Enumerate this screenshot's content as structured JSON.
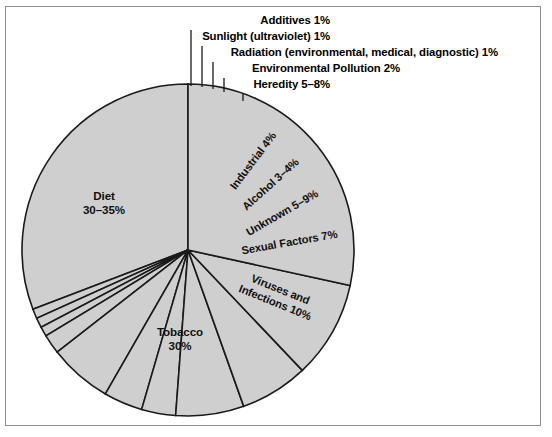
{
  "figure": {
    "background_color": "#ffffff",
    "frame_color": "#8d8d8d",
    "slice_fill": "#cfcfcf",
    "slice_stroke": "#1a1a1a"
  },
  "chart_data": {
    "type": "pie",
    "title": "",
    "subtitle": "",
    "xlabel": "",
    "ylabel": "",
    "grid": false,
    "legend_position": "none",
    "center": {
      "x": 188,
      "y": 250
    },
    "radius": 166,
    "start_angle_deg": -90,
    "direction": "counterclockwise",
    "categories": [
      "Diet",
      "Additives",
      "Sunlight (ultraviolet)",
      "Radiation (environmental, medical, diagnostic)",
      "Environmental Pollution",
      "Heredity",
      "Industrial",
      "Alcohol",
      "Unknown",
      "Sexual Factors",
      "Viruses and Infections",
      "Tobacco"
    ],
    "values": [
      32.5,
      1,
      1,
      1,
      2,
      6.5,
      4,
      3.5,
      7,
      7,
      10,
      30
    ],
    "value_labels": [
      "30–35%",
      "1%",
      "1%",
      "1%",
      "2%",
      "5–8%",
      "4%",
      "3–4%",
      "5–9%",
      "7%",
      "10%",
      "30%"
    ],
    "slices": [
      {
        "name": "diet",
        "category": "Diet",
        "value": 32.5,
        "value_label": "30–35%",
        "label_mode": "inner-horizontal",
        "label_lines": [
          "Diet",
          "30–35%"
        ],
        "label_x": 104,
        "label_y": 200,
        "rotation": 0
      },
      {
        "name": "additives",
        "category": "Additives",
        "value": 1,
        "value_label": "1%",
        "label_mode": "callout",
        "label_text": "Additives 1%",
        "text_x": 330,
        "text_y": 24,
        "leader": {
          "x1": 191,
          "y1": 30,
          "x2": 191,
          "y2": 86
        }
      },
      {
        "name": "sunlight-ultraviolet",
        "category": "Sunlight (ultraviolet)",
        "value": 1,
        "value_label": "1%",
        "label_mode": "callout",
        "label_text": "Sunlight (ultraviolet) 1%",
        "text_x": 330,
        "text_y": 40,
        "leader": {
          "x1": 202,
          "y1": 46,
          "x2": 202,
          "y2": 87
        }
      },
      {
        "name": "radiation",
        "category": "Radiation (environmental, medical, diagnostic)",
        "value": 1,
        "value_label": "1%",
        "label_mode": "callout",
        "label_text": "Radiation (environmental, medical, diagnostic) 1%",
        "text_x": 498,
        "text_y": 56,
        "leader": {
          "x1": 213,
          "y1": 62,
          "x2": 213,
          "y2": 89
        }
      },
      {
        "name": "environmental-pollution",
        "category": "Environmental Pollution",
        "value": 2,
        "value_label": "2%",
        "label_mode": "callout",
        "label_text": "Environmental Pollution 2%",
        "text_x": 400,
        "text_y": 72,
        "leader": {
          "x1": 224,
          "y1": 78,
          "x2": 224,
          "y2": 92
        }
      },
      {
        "name": "heredity",
        "category": "Heredity",
        "value": 6.5,
        "value_label": "5–8%",
        "label_mode": "callout",
        "label_text": "Heredity 5–8%",
        "text_x": 330,
        "text_y": 88,
        "leader": {
          "x1": 243,
          "y1": 94,
          "x2": 243,
          "y2": 101
        }
      },
      {
        "name": "industrial",
        "category": "Industrial",
        "value": 4,
        "value_label": "4%",
        "label_mode": "inner-rotated",
        "label_text": "Industrial 4%",
        "label_x": 256,
        "label_y": 163,
        "rotation": -53
      },
      {
        "name": "alcohol",
        "category": "Alcohol",
        "value": 3.5,
        "value_label": "3–4%",
        "label_mode": "inner-rotated",
        "label_text": "Alcohol 3–4%",
        "label_x": 273,
        "label_y": 187,
        "rotation": -42
      },
      {
        "name": "unknown",
        "category": "Unknown",
        "value": 7,
        "value_label": "5–9%",
        "label_mode": "inner-rotated",
        "label_text": "Unknown 5–9%",
        "label_x": 284,
        "label_y": 216,
        "rotation": -30
      },
      {
        "name": "sexual-factors",
        "category": "Sexual Factors",
        "value": 7,
        "value_label": "7%",
        "label_mode": "inner-rotated",
        "label_text": "Sexual Factors 7%",
        "label_x": 290,
        "label_y": 246,
        "rotation": -10
      },
      {
        "name": "viruses-and-infections",
        "category": "Viruses and Infections",
        "value": 10,
        "value_label": "10%",
        "label_mode": "inner-rotated-two-line",
        "label_lines": [
          "Viruses and",
          "Infections 10%"
        ],
        "label_x": 279,
        "label_y": 293,
        "rotation": 22
      },
      {
        "name": "tobacco",
        "category": "Tobacco",
        "value": 30,
        "value_label": "30%",
        "label_mode": "inner-horizontal",
        "label_lines": [
          "Tobacco",
          "30%"
        ],
        "label_x": 180,
        "label_y": 336,
        "rotation": 0
      }
    ]
  }
}
